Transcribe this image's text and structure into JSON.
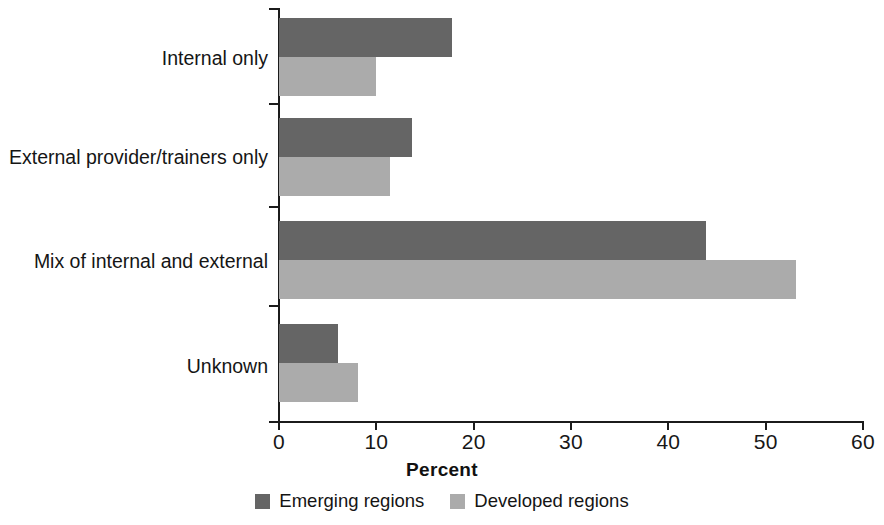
{
  "chart_data": {
    "type": "bar",
    "orientation": "horizontal",
    "title": "",
    "xlabel": "Percent",
    "ylabel": "",
    "xlim": [
      0,
      60
    ],
    "xticks": [
      0,
      10,
      20,
      30,
      40,
      50,
      60
    ],
    "grid": false,
    "legend_position": "bottom",
    "categories": [
      "Internal only",
      "External provider/trainers only",
      "Mix of internal and external",
      "Unknown"
    ],
    "series": [
      {
        "name": "Emerging regions",
        "color": "#656565",
        "values": [
          17.8,
          13.7,
          43.9,
          6.1
        ]
      },
      {
        "name": "Developed regions",
        "color": "#ababab",
        "values": [
          10.0,
          11.4,
          53.1,
          8.1
        ]
      }
    ]
  },
  "axis": {
    "x_label": "Percent",
    "tick_labels": [
      "0",
      "10",
      "20",
      "30",
      "40",
      "50",
      "60"
    ]
  },
  "categories": {
    "c0": "Internal only",
    "c1": "External provider/trainers only",
    "c2": "Mix of internal and external",
    "c3": "Unknown"
  },
  "legend": {
    "items": [
      {
        "label": "Emerging regions",
        "color": "#656565"
      },
      {
        "label": "Developed regions",
        "color": "#ababab"
      }
    ],
    "emerging_label": "Emerging regions",
    "developed_label": "Developed regions"
  }
}
